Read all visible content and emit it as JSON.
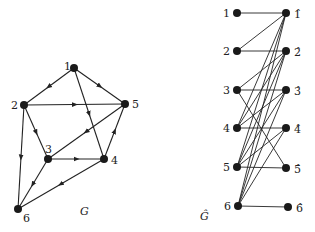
{
  "graph_g": {
    "caption": "G",
    "nodes": [
      {
        "id": "1",
        "label": "1",
        "x": 74,
        "y": 68,
        "lx": 64,
        "ly": 70
      },
      {
        "id": "2",
        "label": "2",
        "x": 24,
        "y": 105,
        "lx": 11,
        "ly": 109
      },
      {
        "id": "3",
        "label": "3",
        "x": 48,
        "y": 159,
        "lx": 45,
        "ly": 153
      },
      {
        "id": "4",
        "label": "4",
        "x": 104,
        "y": 159,
        "lx": 111,
        "ly": 164
      },
      {
        "id": "5",
        "label": "5",
        "x": 125,
        "y": 104,
        "lx": 132,
        "ly": 108
      },
      {
        "id": "6",
        "label": "6",
        "x": 18,
        "y": 209,
        "lx": 23,
        "ly": 222
      }
    ],
    "arcs": [
      [
        "1",
        "2"
      ],
      [
        "1",
        "5"
      ],
      [
        "1",
        "4"
      ],
      [
        "2",
        "5"
      ],
      [
        "2",
        "3"
      ],
      [
        "2",
        "6"
      ],
      [
        "5",
        "3"
      ],
      [
        "3",
        "4"
      ],
      [
        "4",
        "5"
      ],
      [
        "3",
        "6"
      ],
      [
        "4",
        "6"
      ]
    ],
    "caption_pos": {
      "x": 80,
      "y": 215
    }
  },
  "graph_ghat": {
    "caption": "Ĝ",
    "left_nodes": [
      {
        "id": "1",
        "label": "1",
        "x": 237,
        "y": 13
      },
      {
        "id": "2",
        "label": "2",
        "x": 237,
        "y": 51
      },
      {
        "id": "3",
        "label": "3",
        "x": 237,
        "y": 90
      },
      {
        "id": "4",
        "label": "4",
        "x": 237,
        "y": 128
      },
      {
        "id": "5",
        "label": "5",
        "x": 237,
        "y": 167
      },
      {
        "id": "6",
        "label": "6",
        "x": 238,
        "y": 206
      }
    ],
    "right_nodes": [
      {
        "id": "1h",
        "label": "1̂",
        "x": 286,
        "y": 13
      },
      {
        "id": "2h",
        "label": "2̂",
        "x": 286,
        "y": 51
      },
      {
        "id": "3h",
        "label": "3̂",
        "x": 286,
        "y": 90
      },
      {
        "id": "4h",
        "label": "4̂",
        "x": 286,
        "y": 128
      },
      {
        "id": "5h",
        "label": "5̂",
        "x": 286,
        "y": 168
      },
      {
        "id": "6h",
        "label": "6̂",
        "x": 288,
        "y": 207
      }
    ],
    "edges": [
      [
        "1",
        "1h"
      ],
      [
        "2",
        "1h"
      ],
      [
        "4",
        "1h"
      ],
      [
        "5",
        "1h"
      ],
      [
        "6",
        "1h"
      ],
      [
        "2",
        "2h"
      ],
      [
        "3",
        "2h"
      ],
      [
        "5",
        "2h"
      ],
      [
        "6",
        "2h"
      ],
      [
        "4",
        "2h"
      ],
      [
        "3",
        "3h"
      ],
      [
        "6",
        "3h"
      ],
      [
        "5",
        "3h"
      ],
      [
        "4",
        "3h"
      ],
      [
        "4",
        "4h"
      ],
      [
        "5",
        "4h"
      ],
      [
        "6",
        "4h"
      ],
      [
        "5",
        "5h"
      ],
      [
        "3",
        "5h"
      ],
      [
        "6",
        "6h"
      ]
    ],
    "caption_pos": {
      "x": 200,
      "y": 220
    }
  }
}
